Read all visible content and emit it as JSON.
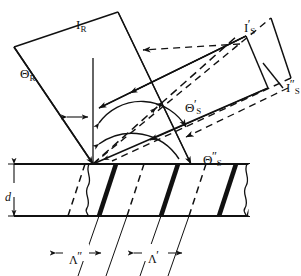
{
  "figure": {
    "type": "optical-bragg-diffraction-diagram",
    "background_color": "#ffffff",
    "line_color": "#111111"
  },
  "labels": {
    "incident_beam": {
      "symbol": "I",
      "subscript": "R",
      "prime": "",
      "x": 76,
      "y": 16
    },
    "diffracted_beam_1": {
      "symbol": "I",
      "subscript": "S",
      "prime": "′",
      "x": 244,
      "y": 18
    },
    "diffracted_beam_2": {
      "symbol": "I",
      "subscript": "S",
      "prime": "″",
      "x": 286,
      "y": 78
    },
    "angle_incident": {
      "symbol": "Θ",
      "subscript": "R",
      "prime": "",
      "x": 20,
      "y": 65
    },
    "angle_diffracted_1": {
      "symbol": "Θ",
      "subscript": "S",
      "prime": "′",
      "x": 185,
      "y": 98
    },
    "angle_diffracted_2": {
      "symbol": "Θ",
      "subscript": "S",
      "prime": "″",
      "x": 203,
      "y": 150
    },
    "thickness": {
      "symbol": "d",
      "subscript": "",
      "prime": "",
      "x": 5,
      "y": 188
    },
    "period_2": {
      "symbol": "Λ",
      "subscript": "",
      "prime": "″",
      "x": 69,
      "y": 250
    },
    "period_1": {
      "symbol": "Λ",
      "subscript": "",
      "prime": "′",
      "x": 148,
      "y": 249
    }
  },
  "geometry": {
    "slab": {
      "top_y": 164,
      "bottom_y": 216,
      "left_x": 14,
      "right_x": 250
    },
    "origin_vertex": {
      "x": 93,
      "y": 164
    },
    "second_vertex": {
      "x": 191,
      "y": 164
    },
    "fringe_count": 4,
    "fringe_tilt": "slanted-right"
  }
}
